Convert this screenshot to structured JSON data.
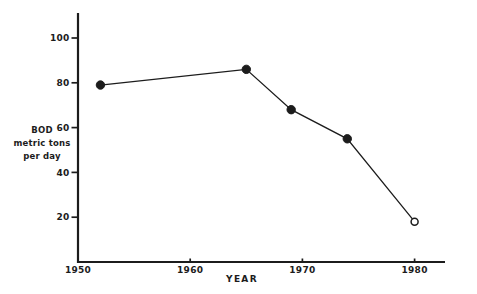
{
  "window": {
    "width": 477,
    "height": 294,
    "background": "#ffffff",
    "ink": "#1c1c1c"
  },
  "axis_titles": {
    "y_line1": "BOD",
    "y_line2": "metric tons",
    "y_line3": "per day",
    "x": "YEAR"
  },
  "chart_data": {
    "type": "line",
    "xlabel": "YEAR",
    "ylabel": "BOD metric tons per day",
    "x": [
      1952,
      1965,
      1969,
      1974,
      1980
    ],
    "series": [
      {
        "name": "BOD",
        "values": [
          79,
          86,
          68,
          55,
          18
        ],
        "markers": [
          "filled-circle",
          "filled-circle",
          "filled-circle",
          "filled-circle",
          "open-circle"
        ]
      }
    ],
    "x_ticks": [
      1950,
      1960,
      1970,
      1980
    ],
    "y_ticks": [
      20,
      40,
      60,
      80,
      100
    ],
    "xlim": [
      1950,
      1982.7
    ],
    "ylim": [
      0,
      111
    ],
    "grid": false,
    "line_color": "#1c1c1c"
  }
}
